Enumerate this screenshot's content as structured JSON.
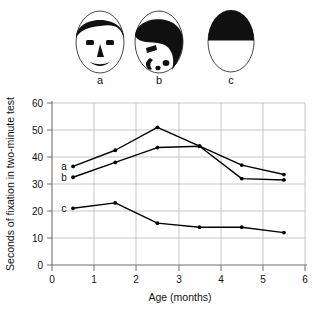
{
  "figure": {
    "stimuli": [
      {
        "id": "a",
        "label": "a",
        "icon": "normal-face-icon",
        "description": "schematic normal face"
      },
      {
        "id": "b",
        "label": "b",
        "icon": "scrambled-face-icon",
        "description": "scrambled face features"
      },
      {
        "id": "c",
        "label": "c",
        "icon": "blank-face-icon",
        "description": "blank oval with solid top"
      }
    ]
  },
  "chart_data": {
    "type": "line",
    "title": "",
    "xlabel": "Age (months)",
    "ylabel": "Seconds of fixation in two-minute test",
    "xlim": [
      0,
      6
    ],
    "ylim": [
      0,
      60
    ],
    "xticks": [
      "0",
      "1",
      "2",
      "3",
      "4",
      "5",
      "6"
    ],
    "yticks": [
      "0",
      "10",
      "20",
      "30",
      "40",
      "50",
      "60"
    ],
    "grid": true,
    "legend": "inline-left",
    "x": [
      0.5,
      1.5,
      2.5,
      3.5,
      4.5,
      5.5
    ],
    "series": [
      {
        "name": "a",
        "label": "a",
        "color": "#000000",
        "values": [
          36.5,
          42.5,
          51.0,
          44.0,
          37.0,
          33.5
        ]
      },
      {
        "name": "b",
        "label": "b",
        "color": "#000000",
        "values": [
          32.5,
          38.0,
          43.5,
          44.0,
          32.0,
          31.5
        ]
      },
      {
        "name": "c",
        "label": "c",
        "color": "#000000",
        "values": [
          21.0,
          23.0,
          15.5,
          14.0,
          14.0,
          12.0
        ]
      }
    ]
  },
  "colors": {
    "grid": "#b9b9b9",
    "axis": "#6e6e6e",
    "line": "#1a1a1a",
    "ink": "#111111",
    "paper": "#ffffff"
  }
}
